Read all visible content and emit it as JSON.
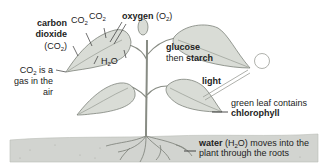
{
  "colors": {
    "leaf_fill": "#d9dcd6",
    "leaf_stroke": "#6f746c",
    "soil_fill": "#d2d4d0",
    "stem": "#888c84",
    "text": "#222222"
  },
  "labels": {
    "carbon_dioxide": {
      "line1": "carbon",
      "line2": "dioxide",
      "formula_open": "(CO",
      "formula_sub": "2",
      "formula_close": ")"
    },
    "co2_left": {
      "main": "CO",
      "sub": "2"
    },
    "co2_right": {
      "main": "CO",
      "sub": "2"
    },
    "oxygen": {
      "bold": "oxygen",
      "formula_open": " (O",
      "formula_sub": "2",
      "formula_close": ")"
    },
    "water_leaf": {
      "main": "H",
      "sub": "2",
      "rest": "O"
    },
    "co2_gas": {
      "line1_main": "CO",
      "line1_sub": "2",
      "line1_rest": " is a",
      "line2": "gas in the",
      "line3": "air"
    },
    "glucose": {
      "line1": "glucose",
      "line2_plain": "then ",
      "line2_bold": "starch"
    },
    "light": "light",
    "chlorophyll": {
      "line1": "green leaf contains",
      "line2": "chlorophyll"
    },
    "water_roots": {
      "bold": "water",
      "formula_open": " (H",
      "formula_sub": "2",
      "formula_close": "O) moves into the",
      "line2": "plant through the roots"
    }
  },
  "icons": {
    "sun": "sun-icon",
    "plant": "plant-illustration"
  }
}
